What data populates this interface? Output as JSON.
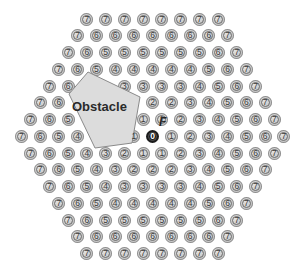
{
  "obstacle": {
    "label": "Obstacle",
    "fill": "#dcdcdc",
    "stroke": "#8a8a8a"
  },
  "goal": {
    "label": "F",
    "value": 0
  },
  "grid_rows": [
    [
      7,
      7,
      7,
      7,
      7,
      7,
      7,
      7
    ],
    [
      7,
      6,
      6,
      6,
      6,
      6,
      6,
      6,
      7
    ],
    [
      7,
      6,
      5,
      5,
      5,
      5,
      5,
      5,
      6,
      7
    ],
    [
      7,
      6,
      5,
      4,
      4,
      4,
      4,
      4,
      5,
      6,
      7
    ],
    [
      7,
      6,
      null,
      null,
      3,
      3,
      3,
      3,
      4,
      5,
      6,
      7
    ],
    [
      7,
      6,
      null,
      null,
      null,
      null,
      2,
      2,
      3,
      4,
      5,
      6,
      7
    ],
    [
      7,
      6,
      5,
      null,
      null,
      null,
      1,
      1,
      2,
      3,
      4,
      5,
      6,
      7
    ],
    [
      7,
      6,
      5,
      4,
      null,
      null,
      1,
      0,
      1,
      2,
      3,
      4,
      5,
      6,
      7
    ],
    [
      7,
      6,
      5,
      4,
      3,
      2,
      1,
      1,
      2,
      3,
      4,
      5,
      6,
      7
    ],
    [
      7,
      6,
      5,
      4,
      3,
      2,
      2,
      2,
      3,
      4,
      5,
      6,
      7
    ],
    [
      7,
      6,
      5,
      4,
      3,
      3,
      3,
      3,
      4,
      5,
      6,
      7
    ],
    [
      7,
      6,
      5,
      4,
      4,
      4,
      4,
      4,
      5,
      6,
      7
    ],
    [
      7,
      6,
      5,
      5,
      5,
      5,
      5,
      5,
      6,
      7
    ],
    [
      7,
      6,
      6,
      6,
      6,
      6,
      6,
      6,
      7
    ],
    [
      7,
      7,
      7,
      7,
      7,
      7,
      7,
      7
    ]
  ]
}
